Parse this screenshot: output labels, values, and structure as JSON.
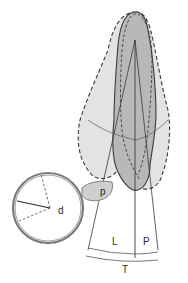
{
  "diagram": {
    "labels": {
      "magnified_p": "p",
      "magnifier_d": "d",
      "lingual": "L",
      "palatal": "P",
      "total": "T"
    },
    "colors": {
      "outer_fill": "#e3e3e3",
      "inner_fill": "#b8b8b8",
      "stroke": "#3a3a3a",
      "magnifier_ring": "#7a7a7a",
      "background": "#ffffff"
    }
  }
}
